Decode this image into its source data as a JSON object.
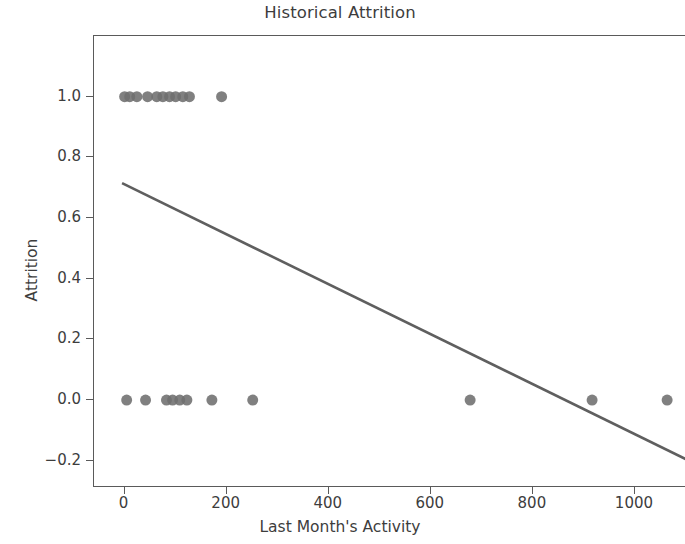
{
  "chart_data": {
    "type": "scatter",
    "title": "Historical Attrition",
    "xlabel": "Last Month's Activity",
    "ylabel": "Attrition",
    "xlim": [
      -60,
      1100
    ],
    "ylim": [
      -0.29,
      1.2
    ],
    "xticks": [
      0,
      200,
      400,
      600,
      800,
      1000
    ],
    "xtick_labels": [
      "0",
      "200",
      "400",
      "600",
      "800",
      "1000"
    ],
    "yticks": [
      1.0,
      0.8,
      0.6,
      0.4,
      0.2,
      0.0,
      -0.2
    ],
    "ytick_labels": [
      "1.0",
      "0.8",
      "0.6",
      "0.4",
      "0.2",
      "0.0",
      "−0.2"
    ],
    "grid": false,
    "legend": null,
    "marker_color": "#6e6e6e",
    "line_color": "#5f5f5f",
    "background_color": "#ffffff",
    "axis_color": "#5a5a5a",
    "series": [
      {
        "name": "observations",
        "type": "scatter",
        "marker": "circle",
        "marker_size": 11,
        "points": [
          {
            "x": 0,
            "y": 1
          },
          {
            "x": 10,
            "y": 1
          },
          {
            "x": 24,
            "y": 1
          },
          {
            "x": 45,
            "y": 1
          },
          {
            "x": 63,
            "y": 1
          },
          {
            "x": 75,
            "y": 1
          },
          {
            "x": 88,
            "y": 1
          },
          {
            "x": 100,
            "y": 1
          },
          {
            "x": 114,
            "y": 1
          },
          {
            "x": 127,
            "y": 1
          },
          {
            "x": 190,
            "y": 1
          },
          {
            "x": 4,
            "y": 0
          },
          {
            "x": 41,
            "y": 0
          },
          {
            "x": 82,
            "y": 0
          },
          {
            "x": 94,
            "y": 0
          },
          {
            "x": 108,
            "y": 0
          },
          {
            "x": 122,
            "y": 0
          },
          {
            "x": 171,
            "y": 0
          },
          {
            "x": 251,
            "y": 0
          },
          {
            "x": 677,
            "y": 0
          },
          {
            "x": 916,
            "y": 0
          },
          {
            "x": 1063,
            "y": 0
          }
        ]
      },
      {
        "name": "regression-line",
        "type": "line",
        "endpoints": [
          {
            "x": -5,
            "y": 0.715
          },
          {
            "x": 1100,
            "y": -0.195
          }
        ]
      }
    ]
  }
}
